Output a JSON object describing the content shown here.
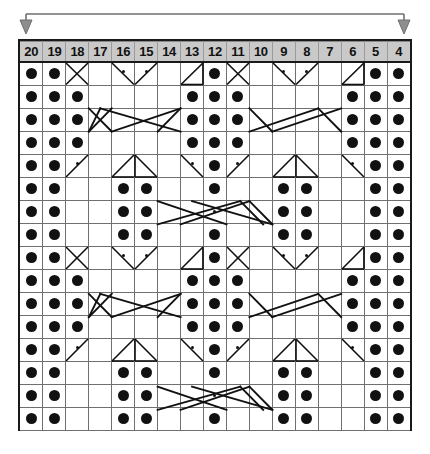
{
  "chart_title": "Knitting Cable Chart",
  "bracket": {
    "name": "pattern-repeat-bracket",
    "left_arrow": "arrow-down",
    "right_arrow": "arrow-down"
  },
  "grid": {
    "columns": 17,
    "rows": 16,
    "column_labels": [
      "20",
      "19",
      "18",
      "17",
      "16",
      "15",
      "14",
      "13",
      "12",
      "11",
      "10",
      "9",
      "8",
      "7",
      "6",
      "5",
      "4"
    ],
    "cell_width": 23,
    "cell_height": 23,
    "header_bg": "#c9c9c9",
    "grid_line_color": "#6f6f6f",
    "border_color": "#1a1a1a",
    "symbol_color": "#111111"
  },
  "legend_symbols": {
    "purl": "large-filled-dot",
    "yarn_over": "small-dot",
    "right_cross": "diagonal-right",
    "left_cross": "diagonal-left",
    "cable": "crossed-diagonals"
  },
  "chart_data": {
    "type": "table",
    "xlabel": "Stitch number",
    "ylabel": "Row",
    "categories": [
      "20",
      "19",
      "18",
      "17",
      "16",
      "15",
      "14",
      "13",
      "12",
      "11",
      "10",
      "9",
      "8",
      "7",
      "6",
      "5",
      "4"
    ],
    "rows": [
      {
        "row": 16,
        "cells": [
          "dot",
          "dot",
          "cross-x",
          "",
          "diag-left-dot",
          "diag-right-dot",
          "",
          "cross-right",
          "dot",
          "cross-x",
          "",
          "diag-left-dot",
          "diag-right-dot",
          "",
          "cross-right",
          "dot",
          "dot"
        ]
      },
      {
        "row": 15,
        "cells": [
          "dot",
          "dot",
          "dot",
          "",
          "",
          "",
          "",
          "dot",
          "dot",
          "dot",
          "",
          "",
          "",
          "",
          "dot",
          "dot",
          "dot"
        ]
      },
      {
        "row": 14,
        "cells": [
          "dot",
          "dot",
          "dot",
          "cable-a",
          "cable-b",
          "cable-c",
          "cable-d",
          "dot",
          "dot",
          "dot",
          "cable-e",
          "cable-f",
          "cable-g",
          "cable-h",
          "dot",
          "dot",
          "dot"
        ]
      },
      {
        "row": 13,
        "cells": [
          "dot",
          "dot",
          "dot",
          "",
          "",
          "",
          "",
          "dot",
          "dot",
          "dot",
          "",
          "",
          "",
          "",
          "dot",
          "dot",
          "dot"
        ]
      },
      {
        "row": 12,
        "cells": [
          "dot",
          "dot",
          "diag-right-dot",
          "",
          "peak-l",
          "peak-r",
          "",
          "diag-left-dot",
          "dot",
          "diag-right-dot",
          "",
          "peak-l",
          "peak-r",
          "",
          "diag-left-dot",
          "dot",
          "dot"
        ]
      },
      {
        "row": 11,
        "cells": [
          "dot",
          "dot",
          "",
          "",
          "dot",
          "dot",
          "",
          "",
          "dot",
          "",
          "",
          "dot",
          "dot",
          "",
          "",
          "dot",
          "dot"
        ]
      },
      {
        "row": 10,
        "cells": [
          "dot",
          "dot",
          "",
          "",
          "dot",
          "dot",
          "cbl-a",
          "cbl-b",
          "sdot",
          "cbl-c",
          "cbl-d",
          "dot",
          "dot",
          "",
          "",
          "dot",
          "dot"
        ]
      },
      {
        "row": 9,
        "cells": [
          "dot",
          "dot",
          "",
          "",
          "dot",
          "dot",
          "",
          "",
          "dot",
          "",
          "",
          "dot",
          "dot",
          "",
          "",
          "dot",
          "dot"
        ]
      },
      {
        "row": 8,
        "cells": [
          "dot",
          "dot",
          "cross-x",
          "",
          "diag-left-dot",
          "diag-right-dot",
          "",
          "cross-right",
          "dot",
          "cross-x",
          "",
          "diag-left-dot",
          "diag-right-dot",
          "",
          "cross-right",
          "dot",
          "dot"
        ]
      },
      {
        "row": 7,
        "cells": [
          "dot",
          "dot",
          "dot",
          "",
          "",
          "",
          "",
          "dot",
          "dot",
          "dot",
          "",
          "",
          "",
          "",
          "dot",
          "dot",
          "dot"
        ]
      },
      {
        "row": 6,
        "cells": [
          "dot",
          "dot",
          "dot",
          "cable-a",
          "cable-b",
          "cable-c",
          "cable-d",
          "dot",
          "dot",
          "dot",
          "cable-e",
          "cable-f",
          "cable-g",
          "cable-h",
          "dot",
          "dot",
          "dot"
        ]
      },
      {
        "row": 5,
        "cells": [
          "dot",
          "dot",
          "dot",
          "",
          "",
          "",
          "",
          "dot",
          "dot",
          "dot",
          "",
          "",
          "",
          "",
          "dot",
          "dot",
          "dot"
        ]
      },
      {
        "row": 4,
        "cells": [
          "dot",
          "dot",
          "diag-right-dot",
          "",
          "peak-l",
          "peak-r",
          "",
          "diag-left-dot",
          "dot",
          "diag-right-dot",
          "",
          "peak-l",
          "peak-r",
          "",
          "diag-left-dot",
          "dot",
          "dot"
        ]
      },
      {
        "row": 3,
        "cells": [
          "dot",
          "dot",
          "",
          "",
          "dot",
          "dot",
          "",
          "",
          "dot",
          "",
          "",
          "dot",
          "dot",
          "",
          "",
          "dot",
          "dot"
        ]
      },
      {
        "row": 2,
        "cells": [
          "dot",
          "dot",
          "",
          "",
          "dot",
          "dot",
          "cbl-a",
          "cbl-b",
          "sdot",
          "cbl-c",
          "cbl-d",
          "dot",
          "dot",
          "",
          "",
          "dot",
          "dot"
        ]
      },
      {
        "row": 1,
        "cells": [
          "dot",
          "dot",
          "",
          "",
          "dot",
          "dot",
          "",
          "",
          "dot",
          "",
          "",
          "dot",
          "dot",
          "",
          "",
          "dot",
          "dot"
        ]
      }
    ]
  }
}
